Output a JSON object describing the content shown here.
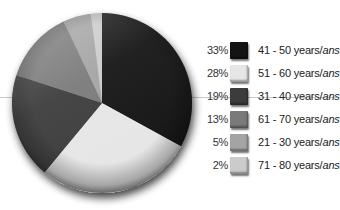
{
  "chart_data": {
    "type": "pie",
    "title": "",
    "start_angle_deg": 0,
    "direction": "clockwise",
    "slices": [
      {
        "label": "41 - 50 years/ans",
        "range": "41 - 50",
        "value": 33,
        "pct_label": "33%",
        "color": "#141414"
      },
      {
        "label": "51 - 60 years/ans",
        "range": "51 - 60",
        "value": 28,
        "pct_label": "28%",
        "color": "#e6e6e6"
      },
      {
        "label": "31 - 40 years/ans",
        "range": "31 - 40",
        "value": 19,
        "pct_label": "19%",
        "color": "#3c3c3c"
      },
      {
        "label": "61 - 70 years/ans",
        "range": "61 - 70",
        "value": 13,
        "pct_label": "13%",
        "color": "#7a7a7a"
      },
      {
        "label": "21 - 30 years/ans",
        "range": "21 - 30",
        "value": 5,
        "pct_label": "5%",
        "color": "#a4a4a4"
      },
      {
        "label": "71 - 80 years/ans",
        "range": "71 - 80",
        "value": 2,
        "pct_label": "2%",
        "color": "#cbcbcb"
      }
    ],
    "legend_position": "right"
  },
  "legend": {
    "items": [
      {
        "pct": "33%",
        "range": "41 - 50",
        "unit": " years/",
        "unit_fr": "ans",
        "color": "#141414"
      },
      {
        "pct": "28%",
        "range": "51 - 60",
        "unit": " years/",
        "unit_fr": "ans",
        "color": "#e6e6e6"
      },
      {
        "pct": "19%",
        "range": "31 - 40",
        "unit": " years/",
        "unit_fr": "ans",
        "color": "#3c3c3c"
      },
      {
        "pct": "13%",
        "range": "61 - 70",
        "unit": " years/",
        "unit_fr": "ans",
        "color": "#7a7a7a"
      },
      {
        "pct": "5%",
        "range": "21 - 30",
        "unit": " years/",
        "unit_fr": "ans",
        "color": "#a4a4a4"
      },
      {
        "pct": "2%",
        "range": "71 - 80",
        "unit": " years/",
        "unit_fr": "ans",
        "color": "#cbcbcb"
      }
    ]
  }
}
